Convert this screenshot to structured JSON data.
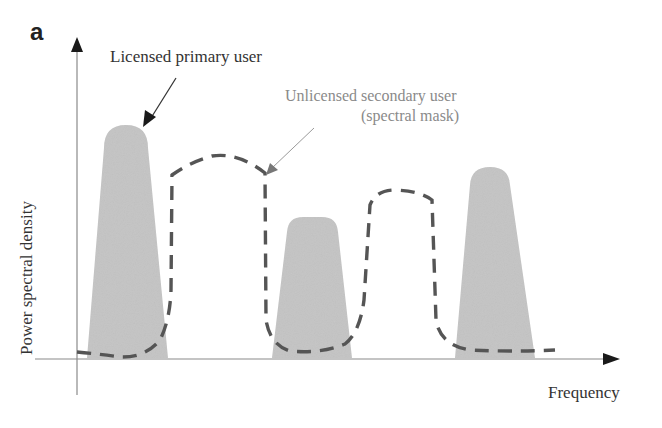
{
  "figure": {
    "panel_label": "a",
    "annotations": {
      "primary_user": "Licensed primary user",
      "secondary_user_line1": "Unlicensed secondary user",
      "secondary_user_line2": "(spectral mask)"
    },
    "axes": {
      "ylabel": "Power spectral density",
      "xlabel": "Frequency"
    },
    "colors": {
      "primary_fill": "#c4c4c4",
      "mask_stroke": "#555555",
      "axis": "#888888",
      "arrowhead": "#1a1a1a"
    },
    "primary_users": [
      {
        "name": "primary-user-1",
        "base_left": 87,
        "base_right": 168,
        "top_left": 104,
        "top_right": 148,
        "top_y": 125
      },
      {
        "name": "primary-user-2",
        "base_left": 272,
        "base_right": 352,
        "top_left": 287,
        "top_right": 338,
        "top_y": 217
      },
      {
        "name": "primary-user-3",
        "base_left": 455,
        "base_right": 535,
        "top_left": 470,
        "top_right": 510,
        "top_y": 167
      }
    ],
    "spectral_mask_gaps": [
      {
        "name": "gap-1",
        "from": 172,
        "to": 265
      },
      {
        "name": "gap-2",
        "from": 372,
        "to": 435
      }
    ]
  }
}
